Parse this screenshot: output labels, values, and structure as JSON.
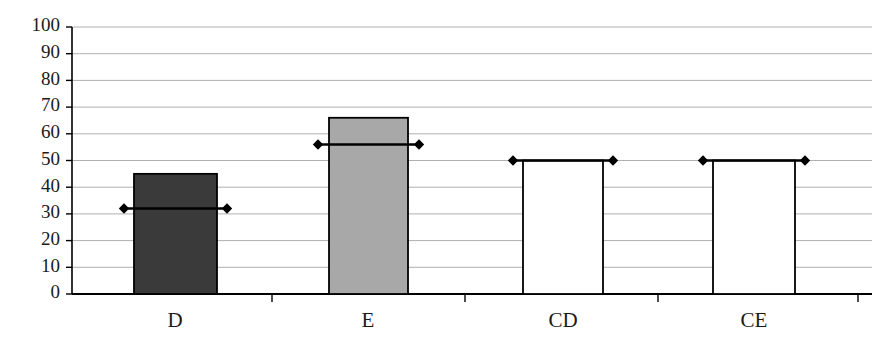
{
  "chart_data": {
    "type": "bar",
    "title": "",
    "xlabel": "",
    "ylabel": "",
    "categories": [
      "D",
      "E",
      "CD",
      "CE"
    ],
    "values": [
      45,
      66,
      50,
      50
    ],
    "series": [
      {
        "name": "bar-value",
        "values": [
          45,
          66,
          50,
          50
        ]
      },
      {
        "name": "marker-line-value",
        "values": [
          32,
          56,
          50,
          50
        ]
      }
    ],
    "bar_colors": [
      "#3a3a3a",
      "#a8a8a8",
      "#ffffff",
      "#ffffff"
    ],
    "bar_border_color": "#000000",
    "marker_color": "#000000",
    "marker_shape": "diamond",
    "ylim": [
      0,
      100
    ],
    "yticks": [
      0,
      10,
      20,
      30,
      40,
      50,
      60,
      70,
      80,
      90,
      100
    ],
    "ytick_labels": [
      "0",
      "10",
      "20",
      "30",
      "40",
      "50",
      "60",
      "70",
      "80",
      "90",
      "100"
    ],
    "grid": true,
    "grid_color": "#b0b0b0",
    "axis_color": "#000000",
    "legend": "none"
  },
  "axes": {
    "y_axis_name": "value-axis",
    "x_axis_name": "category-axis"
  }
}
